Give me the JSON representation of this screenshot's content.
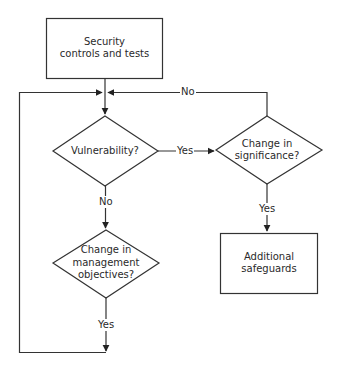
{
  "nodes": {
    "start": {
      "type": "process",
      "lines": [
        "Security",
        "controls and tests"
      ]
    },
    "vulnerability": {
      "type": "decision",
      "lines": [
        "Vulnerability?"
      ]
    },
    "significance": {
      "type": "decision",
      "lines": [
        "Change in",
        "significance?"
      ]
    },
    "management": {
      "type": "decision",
      "lines": [
        "Change in",
        "management",
        "objectives?"
      ]
    },
    "safeguards": {
      "type": "process",
      "lines": [
        "Additional",
        "safeguards"
      ]
    }
  },
  "edges": {
    "vuln_yes": "Yes",
    "vuln_no": "No",
    "sig_no": "No",
    "sig_yes": "Yes",
    "mgmt_yes": "Yes"
  },
  "colors": {
    "stroke": "#333333",
    "text": "#2a2a2a",
    "background": "#ffffff"
  }
}
